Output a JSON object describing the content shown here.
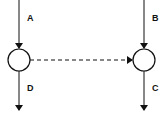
{
  "diagram": {
    "type": "flow",
    "nodes": [
      {
        "id": "left-node",
        "shape": "circle",
        "cx": 19,
        "cy": 60,
        "r": 11
      },
      {
        "id": "right-node",
        "shape": "circle",
        "cx": 144,
        "cy": 60,
        "r": 11
      }
    ],
    "edges": [
      {
        "label": "A",
        "from": "top",
        "to": "left-node",
        "style": "solid"
      },
      {
        "label": "D",
        "from": "left-node",
        "to": "bottom",
        "style": "solid"
      },
      {
        "label": "B",
        "from": "top",
        "to": "right-node",
        "style": "solid"
      },
      {
        "label": "C",
        "from": "right-node",
        "to": "bottom",
        "style": "solid"
      },
      {
        "label": "",
        "from": "left-node",
        "to": "right-node",
        "style": "dashed"
      }
    ],
    "labels": {
      "a": "A",
      "b": "B",
      "c": "C",
      "d": "D"
    },
    "colors": {
      "stroke": "#111111",
      "background": "#ffffff"
    }
  }
}
